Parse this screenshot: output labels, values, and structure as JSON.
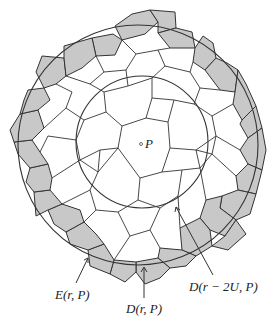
{
  "diagram": {
    "point_label": "P",
    "labels": {
      "outer_annulus": "E(r, P)",
      "outer_disk": "D(r, P)",
      "inner_disk": "D(r − 2U, P)"
    },
    "colors": {
      "shaded_cells": "#c8c8c8",
      "cell_edges": "#333333",
      "circles": "#333333",
      "background": "#ffffff"
    },
    "geometry": {
      "outer_circle": {
        "cx": 138,
        "cy": 145,
        "r": 120
      },
      "inner_circle": {
        "cx": 142,
        "cy": 142,
        "r": 66
      },
      "point_P": {
        "x": 141,
        "y": 144
      }
    }
  }
}
